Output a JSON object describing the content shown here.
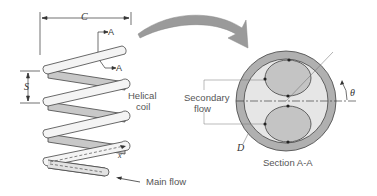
{
  "figure": {
    "labels": {
      "pitch": "C",
      "spacing": "S",
      "section_top": "A",
      "section_bottom": "A",
      "coil_line1": "Helical",
      "coil_line2": "coil",
      "axial_coord": "x",
      "main_flow": "Main flow",
      "secondary_line1": "Secondary",
      "secondary_line2": "flow",
      "angle": "θ",
      "diameter": "D",
      "section_title": "Section A-A"
    },
    "colors": {
      "tube_fill": "#f4f4f4",
      "tube_shadow": "#c8c8c8",
      "outline": "#444444",
      "arrow_fill": "#9a9a9a",
      "pipe_wall": "#b0b0b0",
      "pipe_inner": "#e6e6e6",
      "vortex": "#c4c4c4"
    }
  }
}
